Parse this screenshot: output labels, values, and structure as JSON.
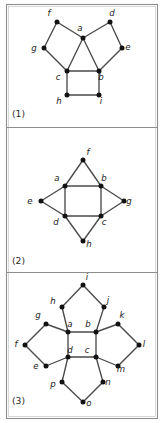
{
  "figure": {
    "background_color": "#ffffff",
    "frame_color": "#8e8e8e",
    "edge_color": "#4a4a4a",
    "vertex_color": "#121212",
    "label_color": "#1a1a1a",
    "width": 165,
    "height": 423
  },
  "frame": {
    "x": 6,
    "y": 4,
    "width": 151,
    "height": 414,
    "dividers": [
      127,
      272
    ]
  },
  "panels": [
    {
      "id": "panel-1",
      "caption": "(1)",
      "caption_x": 12,
      "caption_y": 117,
      "vertex_count": 9,
      "edge_count": 12,
      "vertices": [
        {
          "label": "a",
          "x": 83,
          "y": 38,
          "lx": 80,
          "ly": 31
        },
        {
          "label": "b",
          "x": 99,
          "y": 71,
          "lx": 101,
          "ly": 80
        },
        {
          "label": "c",
          "x": 67,
          "y": 71,
          "lx": 58,
          "ly": 80
        },
        {
          "label": "d",
          "x": 110,
          "y": 22,
          "lx": 112,
          "ly": 16
        },
        {
          "label": "e",
          "x": 122,
          "y": 48,
          "lx": 128,
          "ly": 50
        },
        {
          "label": "f",
          "x": 57,
          "y": 22,
          "lx": 49,
          "ly": 16
        },
        {
          "label": "g",
          "x": 44,
          "y": 48,
          "lx": 34,
          "ly": 51
        },
        {
          "label": "h",
          "x": 67,
          "y": 95,
          "lx": 59,
          "ly": 104
        },
        {
          "label": "i",
          "x": 99,
          "y": 95,
          "lx": 101,
          "ly": 104
        }
      ],
      "edges": [
        [
          "a",
          "b"
        ],
        [
          "a",
          "c"
        ],
        [
          "b",
          "c"
        ],
        [
          "a",
          "d"
        ],
        [
          "d",
          "e"
        ],
        [
          "e",
          "b"
        ],
        [
          "a",
          "f"
        ],
        [
          "f",
          "g"
        ],
        [
          "g",
          "c"
        ],
        [
          "c",
          "h"
        ],
        [
          "h",
          "i"
        ],
        [
          "i",
          "b"
        ]
      ]
    },
    {
      "id": "panel-2",
      "caption": "(2)",
      "caption_x": 12,
      "caption_y": 264,
      "vertex_count": 8,
      "edge_count": 12,
      "vertices": [
        {
          "label": "a",
          "x": 65,
          "y": 186,
          "lx": 57,
          "ly": 181
        },
        {
          "label": "b",
          "x": 101,
          "y": 186,
          "lx": 104,
          "ly": 181
        },
        {
          "label": "c",
          "x": 101,
          "y": 216,
          "lx": 104,
          "ly": 225
        },
        {
          "label": "d",
          "x": 65,
          "y": 216,
          "lx": 56,
          "ly": 225
        },
        {
          "label": "e",
          "x": 41,
          "y": 201,
          "lx": 30,
          "ly": 204
        },
        {
          "label": "f",
          "x": 83,
          "y": 160,
          "lx": 88,
          "ly": 155
        },
        {
          "label": "g",
          "x": 124,
          "y": 201,
          "lx": 129,
          "ly": 204
        },
        {
          "label": "h",
          "x": 83,
          "y": 241,
          "lx": 89,
          "ly": 247
        }
      ],
      "edges": [
        [
          "a",
          "b"
        ],
        [
          "b",
          "c"
        ],
        [
          "c",
          "d"
        ],
        [
          "d",
          "a"
        ],
        [
          "a",
          "f"
        ],
        [
          "f",
          "b"
        ],
        [
          "b",
          "g"
        ],
        [
          "g",
          "c"
        ],
        [
          "c",
          "h"
        ],
        [
          "h",
          "d"
        ],
        [
          "d",
          "e"
        ],
        [
          "e",
          "a"
        ]
      ]
    },
    {
      "id": "panel-3",
      "caption": "(3)",
      "caption_x": 12,
      "caption_y": 404,
      "vertex_count": 16,
      "edge_count": 24,
      "vertices": [
        {
          "label": "a",
          "x": 68,
          "y": 332,
          "lx": 70,
          "ly": 327
        },
        {
          "label": "b",
          "x": 96,
          "y": 332,
          "lx": 88,
          "ly": 327
        },
        {
          "label": "c",
          "x": 96,
          "y": 357,
          "lx": 87,
          "ly": 353
        },
        {
          "label": "d",
          "x": 68,
          "y": 357,
          "lx": 70,
          "ly": 353
        },
        {
          "label": "e",
          "x": 46,
          "y": 366,
          "lx": 36,
          "ly": 369
        },
        {
          "label": "f",
          "x": 25,
          "y": 345,
          "lx": 16,
          "ly": 347
        },
        {
          "label": "g",
          "x": 46,
          "y": 324,
          "lx": 38,
          "ly": 318
        },
        {
          "label": "h",
          "x": 62,
          "y": 307,
          "lx": 53,
          "ly": 304
        },
        {
          "label": "i",
          "x": 83,
          "y": 285,
          "lx": 87,
          "ly": 280
        },
        {
          "label": "j",
          "x": 104,
          "y": 307,
          "lx": 108,
          "ly": 303
        },
        {
          "label": "k",
          "x": 118,
          "y": 324,
          "lx": 122,
          "ly": 318
        },
        {
          "label": "l",
          "x": 139,
          "y": 345,
          "lx": 144,
          "ly": 347
        },
        {
          "label": "m",
          "x": 118,
          "y": 366,
          "lx": 121,
          "ly": 372
        },
        {
          "label": "n",
          "x": 103,
          "y": 382,
          "lx": 108,
          "ly": 385
        },
        {
          "label": "o",
          "x": 83,
          "y": 402,
          "lx": 89,
          "ly": 406
        },
        {
          "label": "p",
          "x": 62,
          "y": 382,
          "lx": 53,
          "ly": 387
        }
      ],
      "edges": [
        [
          "a",
          "b"
        ],
        [
          "b",
          "c"
        ],
        [
          "c",
          "d"
        ],
        [
          "d",
          "a"
        ],
        [
          "a",
          "h"
        ],
        [
          "h",
          "i"
        ],
        [
          "i",
          "j"
        ],
        [
          "j",
          "b"
        ],
        [
          "a",
          "g"
        ],
        [
          "g",
          "f"
        ],
        [
          "f",
          "e"
        ],
        [
          "e",
          "d"
        ],
        [
          "b",
          "k"
        ],
        [
          "k",
          "l"
        ],
        [
          "l",
          "m"
        ],
        [
          "m",
          "c"
        ],
        [
          "d",
          "p"
        ],
        [
          "p",
          "o"
        ],
        [
          "o",
          "n"
        ],
        [
          "n",
          "c"
        ]
      ]
    }
  ]
}
